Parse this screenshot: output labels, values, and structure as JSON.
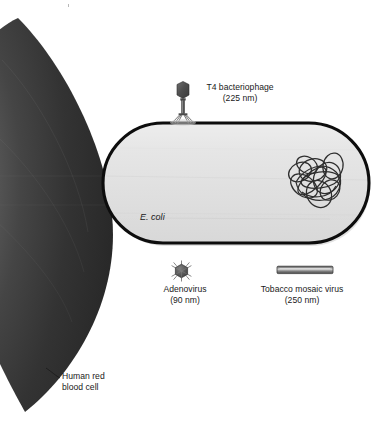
{
  "figure": {
    "background_color": "#ffffff",
    "width": 383,
    "height": 424
  },
  "organisms": {
    "red_blood_cell": {
      "name": "Human red blood cell",
      "label_line1": "Human red",
      "label_line2": "blood cell",
      "fill_dark": "#2b2b2b",
      "fill_light": "#6e6e6e",
      "leader_line": true
    },
    "ecoli": {
      "name": "E. coli",
      "label": "E. coli",
      "italic": true,
      "outline_color": "#111111",
      "fill_color": "#e2e2e2"
    },
    "t4_bacteriophage": {
      "name": "T4 bacteriophage",
      "label_line1": "T4 bacteriophage",
      "label_line2": "(225 nm)",
      "size_nm": 225,
      "color": "#4d4d4d"
    },
    "adenovirus": {
      "name": "Adenovirus",
      "label_line1": "Adenovirus",
      "label_line2": "(90 nm)",
      "size_nm": 90,
      "color": "#555555"
    },
    "tobacco_mosaic_virus": {
      "name": "Tobacco mosaic virus",
      "label_line1": "Tobacco mosaic virus",
      "label_line2": "(250 nm)",
      "size_nm": 250,
      "color": "#666666"
    },
    "nucleoid": {
      "name": "Bacterial chromosome",
      "stroke_color": "#2f2f2f"
    }
  }
}
